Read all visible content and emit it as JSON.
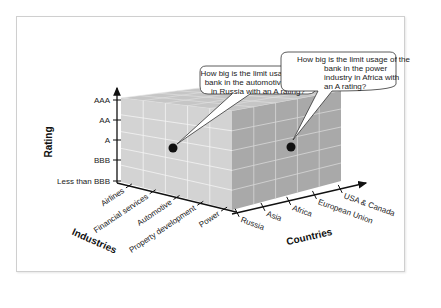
{
  "diagram": {
    "title": "",
    "axes": {
      "rating": {
        "title": "Rating",
        "ticks": [
          "AAA",
          "AA",
          "A",
          "BBB",
          "Less than BBB"
        ]
      },
      "industries": {
        "title": "Industries",
        "ticks": [
          "Airlines",
          "Financial services",
          "Automotive",
          "Property development",
          "Power"
        ]
      },
      "countries": {
        "title": "Countries",
        "ticks": [
          "Russia",
          "Asia",
          "Africa",
          "European Union",
          "USA & Canada"
        ]
      }
    },
    "callouts": [
      {
        "lines": [
          "How big is the limit usage of the",
          "bank in the automotive sector",
          "in Russia with an A rating?"
        ],
        "industry": "Automotive",
        "country": "Russia",
        "rating": "A"
      },
      {
        "lines": [
          "How big is the limit usage of the",
          "bank in the power",
          "industry in Africa with",
          "an A rating?"
        ],
        "industry": "Power",
        "country": "Africa",
        "rating": "A"
      }
    ],
    "colors": {
      "front_face": "#d2d2d2",
      "side_face": "#a9a9a9",
      "top_face": "#c4c4c4",
      "grid": "#f2f2f2",
      "marker": "#111111"
    }
  }
}
